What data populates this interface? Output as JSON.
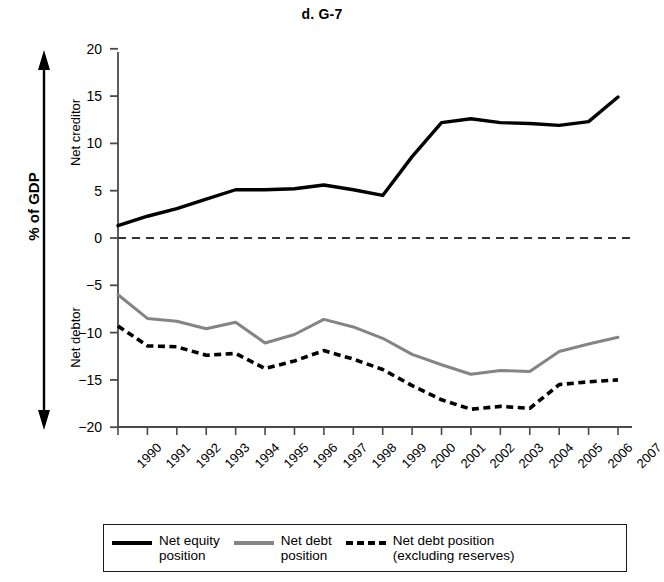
{
  "chart_data": {
    "type": "line",
    "title": "d. G-7",
    "xlabel": "Year",
    "ylabel": "% of GDP",
    "ylim": [
      -20,
      20
    ],
    "yticks": [
      20,
      15,
      10,
      5,
      0,
      -5,
      -10,
      -15,
      -20
    ],
    "ytick_labels": [
      "20",
      "15",
      "10",
      "5",
      "0",
      "−5",
      "−10",
      "−15",
      "−20"
    ],
    "grid": false,
    "zero_line": true,
    "zero_line_style": "dashed",
    "legend_position": "bottom",
    "categories": [
      "1990",
      "1991",
      "1992",
      "1993",
      "1994",
      "1995",
      "1996",
      "1997",
      "1998",
      "1999",
      "2000",
      "2001",
      "2002",
      "2003",
      "2004",
      "2005",
      "2006",
      "2007"
    ],
    "x": [
      1990,
      1991,
      1992,
      1993,
      1994,
      1995,
      1996,
      1997,
      1998,
      1999,
      2000,
      2001,
      2002,
      2003,
      2004,
      2005,
      2006,
      2007
    ],
    "series": [
      {
        "name": "Net equity position",
        "style": "solid",
        "color": "#000000",
        "width": 3.4,
        "values": [
          1.3,
          2.3,
          3.1,
          4.1,
          5.1,
          5.1,
          5.2,
          5.6,
          5.1,
          4.5,
          8.6,
          12.2,
          12.6,
          12.2,
          12.1,
          11.9,
          12.3,
          14.9
        ]
      },
      {
        "name": "Net debt position",
        "style": "solid",
        "color": "#848484",
        "width": 3.0,
        "values": [
          -6.0,
          -8.5,
          -8.8,
          -9.6,
          -8.9,
          -11.1,
          -10.2,
          -8.6,
          -9.4,
          -10.6,
          -12.3,
          -13.4,
          -14.4,
          -14.0,
          -14.1,
          -12.0,
          -11.2,
          -10.5
        ]
      },
      {
        "name": "Net debt position (excluding reserves)",
        "style": "dashed",
        "color": "#000000",
        "width": 3.6,
        "values": [
          -9.3,
          -11.4,
          -11.5,
          -12.4,
          -12.2,
          -13.8,
          -13.0,
          -11.9,
          -12.8,
          -13.9,
          -15.6,
          -17.1,
          -18.1,
          -17.8,
          -18.0,
          -15.5,
          -15.2,
          -15.0
        ]
      }
    ],
    "annotations": [
      {
        "text": "Net creditor",
        "region": "upper",
        "orientation": "vertical"
      },
      {
        "text": "Net debtor",
        "region": "lower",
        "orientation": "vertical"
      }
    ],
    "arrow": {
      "description": "double-headed vertical arrow spanning full y range"
    }
  },
  "legend": {
    "entries": [
      {
        "label": "Net equity\nposition",
        "swatch": "solid-black"
      },
      {
        "label": "Net debt\nposition",
        "swatch": "solid-gray"
      },
      {
        "label": "Net debt position\n(excluding reserves)",
        "swatch": "dashed-black"
      }
    ]
  }
}
